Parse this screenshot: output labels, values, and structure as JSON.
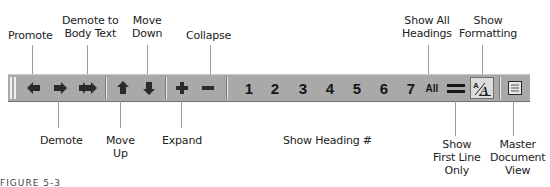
{
  "figure": {
    "caption": "FIGURE 5-3"
  },
  "top_labels": {
    "promote": "Promote",
    "demote_to_body_line1": "Demote to",
    "demote_to_body_line2": "Body Text",
    "move_down_line1": "Move",
    "move_down_line2": "Down",
    "collapse": "Collapse",
    "show_all_headings_line1": "Show All",
    "show_all_headings_line2": "Headings",
    "show_formatting_line1": "Show",
    "show_formatting_line2": "Formatting"
  },
  "bottom_labels": {
    "demote": "Demote",
    "move_up_line1": "Move",
    "move_up_line2": "Up",
    "expand": "Expand",
    "show_heading": "Show Heading #",
    "show_first_line_line1": "Show",
    "show_first_line_line2": "First Line",
    "show_first_line_line3": "Only",
    "master_doc_line1": "Master",
    "master_doc_line2": "Document",
    "master_doc_line3": "View"
  },
  "toolbar": {
    "buttons": [
      {
        "name": "promote",
        "icon": "arrow-left-icon"
      },
      {
        "name": "demote",
        "icon": "arrow-right-icon"
      },
      {
        "name": "demote-to-body-text",
        "icon": "double-arrow-right-icon"
      },
      {
        "name": "move-up",
        "icon": "arrow-up-icon"
      },
      {
        "name": "move-down",
        "icon": "arrow-down-icon"
      },
      {
        "name": "expand",
        "icon": "plus-icon"
      },
      {
        "name": "collapse",
        "icon": "minus-icon"
      }
    ],
    "heading_levels": [
      "1",
      "2",
      "3",
      "4",
      "5",
      "6",
      "7"
    ],
    "show_all_label": "All",
    "show_formatting_glyph": "A",
    "colors": {
      "background": "#a9a9a9",
      "icon": "#2a2a2a",
      "pressed": "#dcdcdc"
    }
  }
}
